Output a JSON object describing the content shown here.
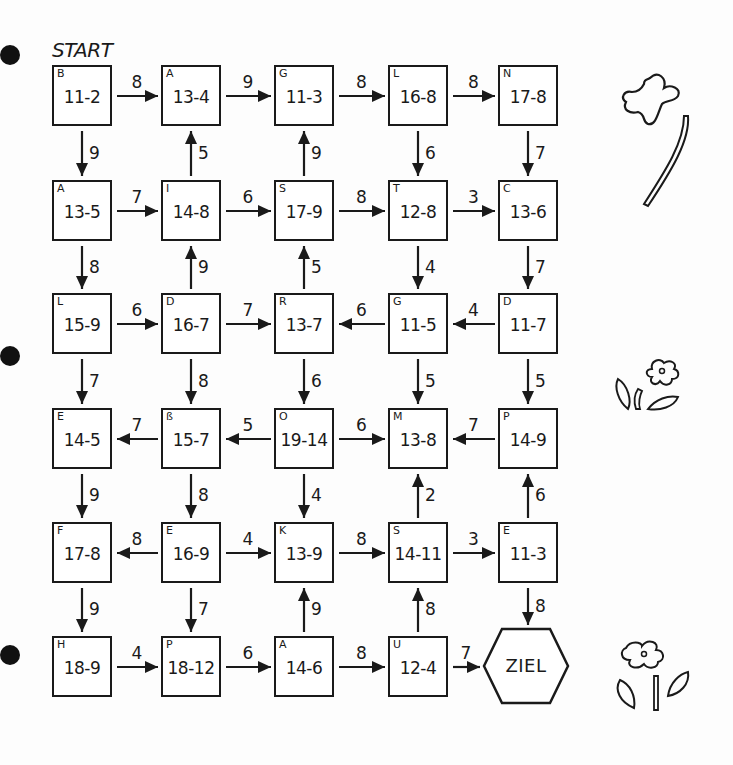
{
  "worksheet": {
    "start_label": "START",
    "goal_label": "ZIEL",
    "ink_color": "#1a1a1a",
    "background_color": "#fdfdfd"
  },
  "boxes": [
    {
      "id": "r0c0",
      "letter": "B",
      "task": "11-2"
    },
    {
      "id": "r0c1",
      "letter": "A",
      "task": "13-4"
    },
    {
      "id": "r0c2",
      "letter": "G",
      "task": "11-3"
    },
    {
      "id": "r0c3",
      "letter": "L",
      "task": "16-8"
    },
    {
      "id": "r0c4",
      "letter": "N",
      "task": "17-8"
    },
    {
      "id": "r1c0",
      "letter": "A",
      "task": "13-5"
    },
    {
      "id": "r1c1",
      "letter": "I",
      "task": "14-8"
    },
    {
      "id": "r1c2",
      "letter": "S",
      "task": "17-9"
    },
    {
      "id": "r1c3",
      "letter": "T",
      "task": "12-8"
    },
    {
      "id": "r1c4",
      "letter": "C",
      "task": "13-6"
    },
    {
      "id": "r2c0",
      "letter": "L",
      "task": "15-9"
    },
    {
      "id": "r2c1",
      "letter": "D",
      "task": "16-7"
    },
    {
      "id": "r2c2",
      "letter": "R",
      "task": "13-7"
    },
    {
      "id": "r2c3",
      "letter": "G",
      "task": "11-5"
    },
    {
      "id": "r2c4",
      "letter": "D",
      "task": "11-7"
    },
    {
      "id": "r3c0",
      "letter": "E",
      "task": "14-5"
    },
    {
      "id": "r3c1",
      "letter": "ß",
      "task": "15-7"
    },
    {
      "id": "r3c2",
      "letter": "O",
      "task": "19-14"
    },
    {
      "id": "r3c3",
      "letter": "M",
      "task": "13-8"
    },
    {
      "id": "r3c4",
      "letter": "P",
      "task": "14-9"
    },
    {
      "id": "r4c0",
      "letter": "F",
      "task": "17-8"
    },
    {
      "id": "r4c1",
      "letter": "E",
      "task": "16-9"
    },
    {
      "id": "r4c2",
      "letter": "K",
      "task": "13-9"
    },
    {
      "id": "r4c3",
      "letter": "S",
      "task": "14-11"
    },
    {
      "id": "r4c4",
      "letter": "E",
      "task": "11-3"
    },
    {
      "id": "r5c0",
      "letter": "H",
      "task": "18-9"
    },
    {
      "id": "r5c1",
      "letter": "P",
      "task": "18-12"
    },
    {
      "id": "r5c2",
      "letter": "A",
      "task": "14-6"
    },
    {
      "id": "r5c3",
      "letter": "U",
      "task": "12-4"
    }
  ],
  "arrows": {
    "horizontal": [
      {
        "row": 0,
        "between": [
          0,
          1
        ],
        "direction": "right",
        "value": "8"
      },
      {
        "row": 0,
        "between": [
          1,
          2
        ],
        "direction": "right",
        "value": "9"
      },
      {
        "row": 0,
        "between": [
          2,
          3
        ],
        "direction": "right",
        "value": "8"
      },
      {
        "row": 0,
        "between": [
          3,
          4
        ],
        "direction": "right",
        "value": "8"
      },
      {
        "row": 1,
        "between": [
          0,
          1
        ],
        "direction": "right",
        "value": "7"
      },
      {
        "row": 1,
        "between": [
          1,
          2
        ],
        "direction": "right",
        "value": "6"
      },
      {
        "row": 1,
        "between": [
          2,
          3
        ],
        "direction": "right",
        "value": "8"
      },
      {
        "row": 1,
        "between": [
          3,
          4
        ],
        "direction": "right",
        "value": "3"
      },
      {
        "row": 2,
        "between": [
          0,
          1
        ],
        "direction": "right",
        "value": "6"
      },
      {
        "row": 2,
        "between": [
          1,
          2
        ],
        "direction": "right",
        "value": "7"
      },
      {
        "row": 2,
        "between": [
          2,
          3
        ],
        "direction": "left",
        "value": "6"
      },
      {
        "row": 2,
        "between": [
          3,
          4
        ],
        "direction": "left",
        "value": "4"
      },
      {
        "row": 3,
        "between": [
          0,
          1
        ],
        "direction": "left",
        "value": "7"
      },
      {
        "row": 3,
        "between": [
          1,
          2
        ],
        "direction": "left",
        "value": "5"
      },
      {
        "row": 3,
        "between": [
          2,
          3
        ],
        "direction": "right",
        "value": "6"
      },
      {
        "row": 3,
        "between": [
          3,
          4
        ],
        "direction": "left",
        "value": "7"
      },
      {
        "row": 4,
        "between": [
          0,
          1
        ],
        "direction": "left",
        "value": "8"
      },
      {
        "row": 4,
        "between": [
          1,
          2
        ],
        "direction": "right",
        "value": "4"
      },
      {
        "row": 4,
        "between": [
          2,
          3
        ],
        "direction": "right",
        "value": "8"
      },
      {
        "row": 4,
        "between": [
          3,
          4
        ],
        "direction": "right",
        "value": "3"
      },
      {
        "row": 5,
        "between": [
          0,
          1
        ],
        "direction": "right",
        "value": "4"
      },
      {
        "row": 5,
        "between": [
          1,
          2
        ],
        "direction": "right",
        "value": "6"
      },
      {
        "row": 5,
        "between": [
          2,
          3
        ],
        "direction": "right",
        "value": "8"
      },
      {
        "row": 5,
        "between": [
          3,
          4
        ],
        "direction": "right",
        "value": "7"
      }
    ],
    "vertical": [
      {
        "col": 0,
        "between": [
          0,
          1
        ],
        "direction": "down",
        "value": "9"
      },
      {
        "col": 1,
        "between": [
          0,
          1
        ],
        "direction": "up",
        "value": "5"
      },
      {
        "col": 2,
        "between": [
          0,
          1
        ],
        "direction": "up",
        "value": "9"
      },
      {
        "col": 3,
        "between": [
          0,
          1
        ],
        "direction": "down",
        "value": "6"
      },
      {
        "col": 4,
        "between": [
          0,
          1
        ],
        "direction": "down",
        "value": "7"
      },
      {
        "col": 0,
        "between": [
          1,
          2
        ],
        "direction": "down",
        "value": "8"
      },
      {
        "col": 1,
        "between": [
          1,
          2
        ],
        "direction": "up",
        "value": "9"
      },
      {
        "col": 2,
        "between": [
          1,
          2
        ],
        "direction": "up",
        "value": "5"
      },
      {
        "col": 3,
        "between": [
          1,
          2
        ],
        "direction": "down",
        "value": "4"
      },
      {
        "col": 4,
        "between": [
          1,
          2
        ],
        "direction": "down",
        "value": "7"
      },
      {
        "col": 0,
        "between": [
          2,
          3
        ],
        "direction": "down",
        "value": "7"
      },
      {
        "col": 1,
        "between": [
          2,
          3
        ],
        "direction": "down",
        "value": "8"
      },
      {
        "col": 2,
        "between": [
          2,
          3
        ],
        "direction": "down",
        "value": "6"
      },
      {
        "col": 3,
        "between": [
          2,
          3
        ],
        "direction": "down",
        "value": "5"
      },
      {
        "col": 4,
        "between": [
          2,
          3
        ],
        "direction": "down",
        "value": "5"
      },
      {
        "col": 0,
        "between": [
          3,
          4
        ],
        "direction": "down",
        "value": "9"
      },
      {
        "col": 1,
        "between": [
          3,
          4
        ],
        "direction": "down",
        "value": "8"
      },
      {
        "col": 2,
        "between": [
          3,
          4
        ],
        "direction": "down",
        "value": "4"
      },
      {
        "col": 3,
        "between": [
          3,
          4
        ],
        "direction": "up",
        "value": "2"
      },
      {
        "col": 4,
        "between": [
          3,
          4
        ],
        "direction": "up",
        "value": "6"
      },
      {
        "col": 0,
        "between": [
          4,
          5
        ],
        "direction": "down",
        "value": "9"
      },
      {
        "col": 1,
        "between": [
          4,
          5
        ],
        "direction": "down",
        "value": "7"
      },
      {
        "col": 2,
        "between": [
          4,
          5
        ],
        "direction": "up",
        "value": "9"
      },
      {
        "col": 3,
        "between": [
          4,
          5
        ],
        "direction": "up",
        "value": "8"
      },
      {
        "col": 4,
        "between": [
          4,
          5
        ],
        "direction": "down",
        "value": "8"
      }
    ]
  },
  "decorations": [
    "flower-with-stem-icon",
    "small-flower-with-leaves-icon",
    "flower-with-leaves-icon"
  ],
  "binder_holes": 3
}
